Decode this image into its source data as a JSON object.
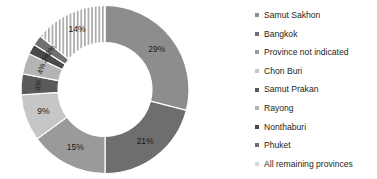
{
  "chart_data": {
    "type": "pie",
    "variant": "donut",
    "title": "",
    "subtitle": "",
    "xlabel": "",
    "ylabel": "",
    "legend_position": "right",
    "grid": false,
    "categories": [
      "Samut Sakhon",
      "Bangkok",
      "Province not indicated",
      "Chon Buri",
      "Samut Prakan",
      "Rayong",
      "Nonthaburi",
      "Phuket",
      "All remaining provinces"
    ],
    "values": [
      29,
      21,
      15,
      9,
      4,
      4,
      2,
      2,
      14
    ],
    "labels": [
      "29%",
      "21%",
      "15%",
      "9%",
      "4%",
      "4%",
      "2%",
      "2%",
      "14%"
    ],
    "colors": [
      "#8d8d8d",
      "#6e6e6e",
      "#9a9a9a",
      "#c6c6c6",
      "#5a5a5a",
      "#b4b4b4",
      "#4a4a4a",
      "#707070",
      "#d8d8d8"
    ],
    "patterns": [
      "solid",
      "solid",
      "solid",
      "solid",
      "solid",
      "solid",
      "solid",
      "solid",
      "vertical-stripes"
    ]
  },
  "legend": {
    "items": [
      {
        "label": "Samut Sakhon",
        "color": "#8d8d8d"
      },
      {
        "label": "Bangkok",
        "color": "#6e6e6e"
      },
      {
        "label": "Province not indicated",
        "color": "#9a9a9a"
      },
      {
        "label": "Chon Buri",
        "color": "#c6c6c6"
      },
      {
        "label": "Samut Prakan",
        "color": "#5a5a5a"
      },
      {
        "label": "Rayong",
        "color": "#b4b4b4"
      },
      {
        "label": "Nonthaburi",
        "color": "#4a4a4a"
      },
      {
        "label": "Phuket",
        "color": "#707070"
      },
      {
        "label": "All remaining provinces",
        "color": "#d8d8d8"
      }
    ]
  }
}
